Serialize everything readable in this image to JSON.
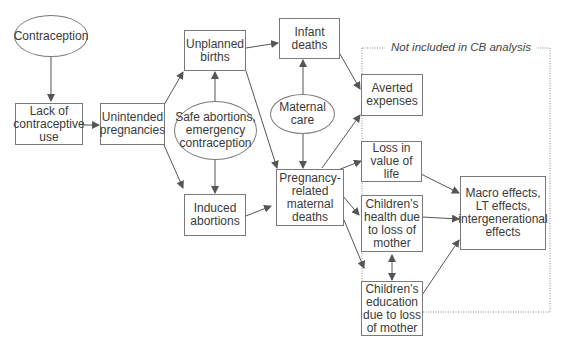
{
  "diagram": {
    "region": {
      "label": "Not included in CB analysis"
    },
    "nodes": {
      "contraception": "Contraception",
      "lack_of_use": "Lack of\ncontraceptive\nuse",
      "unintended_pregnancies": "Unintended\npregnancies",
      "unplanned_births": "Unplanned\nbirths",
      "safe_abortions": "Safe abortions,\nemergency\ncontraception",
      "induced_abortions": "Induced\nabortions",
      "infant_deaths": "Infant\ndeaths",
      "maternal_care": "Maternal\ncare",
      "maternal_deaths": "Pregnancy-\nrelated\nmaternal\ndeaths",
      "averted_expenses": "Averted\nexpenses",
      "loss_value_life": "Loss in\nvalue of\nlife",
      "children_health": "Children’s\nhealth due\nto loss of\nmother",
      "children_education": "Children’s\neducation\ndue to loss\nof mother",
      "macro_effects": "Macro effects,\nLT effects,\nintergenerational\neffects"
    },
    "edges": [
      [
        "contraception",
        "lack_of_use"
      ],
      [
        "lack_of_use",
        "unintended_pregnancies"
      ],
      [
        "unintended_pregnancies",
        "unplanned_births"
      ],
      [
        "unintended_pregnancies",
        "induced_abortions"
      ],
      [
        "safe_abortions",
        "unplanned_births"
      ],
      [
        "safe_abortions",
        "induced_abortions"
      ],
      [
        "unplanned_births",
        "infant_deaths"
      ],
      [
        "unplanned_births",
        "maternal_deaths"
      ],
      [
        "induced_abortions",
        "maternal_deaths"
      ],
      [
        "maternal_care",
        "infant_deaths"
      ],
      [
        "maternal_care",
        "maternal_deaths"
      ],
      [
        "infant_deaths",
        "averted_expenses"
      ],
      [
        "maternal_deaths",
        "averted_expenses"
      ],
      [
        "maternal_deaths",
        "loss_value_life"
      ],
      [
        "maternal_deaths",
        "children_health"
      ],
      [
        "maternal_deaths",
        "children_education"
      ],
      [
        "children_health",
        "children_education"
      ],
      [
        "loss_value_life",
        "macro_effects"
      ],
      [
        "children_health",
        "macro_effects"
      ],
      [
        "children_education",
        "macro_effects"
      ]
    ]
  }
}
